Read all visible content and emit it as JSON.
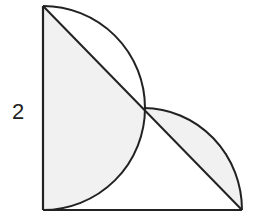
{
  "diagram": {
    "type": "geometry",
    "labels": {
      "side_length": "2"
    },
    "colors": {
      "stroke": "#222222",
      "shade": "#f1f1f1",
      "background": "#ffffff"
    }
  }
}
